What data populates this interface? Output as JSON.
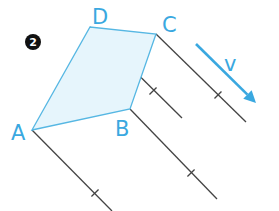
{
  "figure": {
    "number_badge": "2",
    "vertices": [
      {
        "id": "D",
        "label": "D",
        "x": 90,
        "y": 27,
        "lx": 92,
        "ly": 24
      },
      {
        "id": "C",
        "label": "C",
        "x": 156,
        "y": 34,
        "lx": 162,
        "ly": 32
      },
      {
        "id": "B",
        "label": "B",
        "x": 130,
        "y": 109,
        "lx": 115,
        "ly": 136
      },
      {
        "id": "A",
        "label": "A",
        "x": 32,
        "y": 130,
        "lx": 11,
        "ly": 140
      }
    ],
    "velocity_label": "v",
    "colors": {
      "shape_fill": "#e6f5fc",
      "shape_stroke": "#56b7e3",
      "label": "#3aa8e0",
      "arrow": "#3aa8e0",
      "trajectory": "#444444",
      "badge": "#111111"
    },
    "trajectories": [
      {
        "from": "D",
        "x1": 90,
        "y1": 27,
        "x2": 182,
        "y2": 118,
        "tick_x": 153,
        "tick_y": 91
      },
      {
        "from": "C",
        "x1": 156,
        "y1": 34,
        "x2": 246,
        "y2": 122,
        "tick_x": 218,
        "tick_y": 95
      },
      {
        "from": "B",
        "x1": 130,
        "y1": 109,
        "x2": 217,
        "y2": 199,
        "tick_x": 191,
        "tick_y": 173
      },
      {
        "from": "A",
        "x1": 32,
        "y1": 130,
        "x2": 112,
        "y2": 211,
        "tick_x": 95,
        "tick_y": 193
      }
    ],
    "arrow": {
      "x1": 196,
      "y1": 44,
      "x2": 256,
      "y2": 103
    }
  }
}
